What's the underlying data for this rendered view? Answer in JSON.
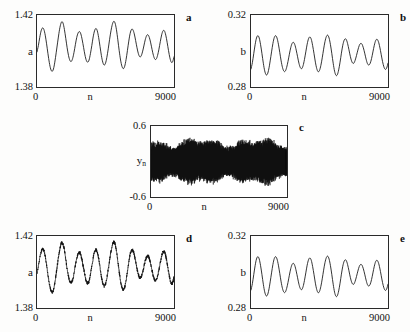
{
  "figure": {
    "background": "#fdfdfc",
    "line_color": "#111111",
    "frame_color": "#2a2a2a",
    "panel_count": 5
  },
  "chart_data": [
    {
      "id": "a",
      "type": "line",
      "panel_letter": "a",
      "title": "",
      "xlabel": "n",
      "ylabel": "a",
      "xlim": [
        0,
        9000
      ],
      "ylim": [
        1.38,
        1.42
      ],
      "xticks": [
        0,
        9000
      ],
      "xticklabels": [
        "0",
        "9000"
      ],
      "yticks": [
        1.38,
        1.42
      ],
      "yticklabels": [
        "1.38",
        "1.42"
      ],
      "grid": false,
      "legend": "none",
      "note": "clean chaotic amplitude-modulated oscillation",
      "x": [
        0,
        90,
        180,
        270,
        360,
        450,
        540,
        630,
        720,
        810,
        900,
        990,
        1080,
        1170,
        1260,
        1350,
        1440,
        1530,
        1620,
        1710,
        1800,
        1890,
        1980,
        2070,
        2160,
        2250,
        2340,
        2430,
        2520,
        2610,
        2700,
        2790,
        2880,
        2970,
        3060,
        3150,
        3240,
        3330,
        3420,
        3510,
        3600,
        3690,
        3780,
        3870,
        3960,
        4050,
        4140,
        4230,
        4320,
        4410,
        4500,
        4590,
        4680,
        4770,
        4860,
        4950,
        5040,
        5130,
        5220,
        5310,
        5400,
        5490,
        5580,
        5670,
        5760,
        5850,
        5940,
        6030,
        6120,
        6210,
        6300,
        6390,
        6480,
        6570,
        6660,
        6750,
        6840,
        6930,
        7020,
        7110,
        7200,
        7290,
        7380,
        7470,
        7560,
        7650,
        7740,
        7830,
        7920,
        8010,
        8100,
        8190,
        8280,
        8370,
        8460,
        8550,
        8640,
        8730,
        8820,
        8910,
        9000
      ],
      "values": [
        1.3995,
        1.403,
        1.4075,
        1.4112,
        1.4128,
        1.412,
        1.4088,
        1.404,
        1.3985,
        1.3935,
        1.39,
        1.3887,
        1.39,
        1.3938,
        1.399,
        1.4045,
        1.4098,
        1.414,
        1.4162,
        1.4155,
        1.412,
        1.407,
        1.4018,
        1.3975,
        1.3948,
        1.3942,
        1.3958,
        1.3992,
        1.4035,
        1.4075,
        1.41,
        1.4108,
        1.4095,
        1.4062,
        1.402,
        1.3978,
        1.3948,
        1.3938,
        1.395,
        1.3985,
        1.403,
        1.4078,
        1.4112,
        1.4125,
        1.4112,
        1.4075,
        1.4025,
        1.3975,
        1.3938,
        1.3922,
        1.3932,
        1.3965,
        1.4012,
        1.4065,
        1.4112,
        1.4148,
        1.4165,
        1.4155,
        1.4118,
        1.4062,
        1.4002,
        1.395,
        1.3915,
        1.3902,
        1.3915,
        1.3952,
        1.4002,
        1.4055,
        1.4098,
        1.412,
        1.4118,
        1.4095,
        1.4058,
        1.4018,
        1.3985,
        1.3968,
        1.3972,
        1.3995,
        1.4028,
        1.4062,
        1.4085,
        1.409,
        1.4075,
        1.4045,
        1.4008,
        1.3975,
        1.3955,
        1.3955,
        1.3975,
        1.401,
        1.4052,
        1.409,
        1.4112,
        1.4112,
        1.4088,
        1.4048,
        1.4002,
        1.3962,
        1.3938,
        1.394,
        1.3968
      ]
    },
    {
      "id": "b",
      "type": "line",
      "panel_letter": "b",
      "title": "",
      "xlabel": "n",
      "ylabel": "b",
      "xlim": [
        0,
        9000
      ],
      "ylim": [
        0.28,
        0.32
      ],
      "xticks": [
        0,
        9000
      ],
      "xticklabels": [
        "0",
        "9000"
      ],
      "yticks": [
        0.28,
        0.32
      ],
      "yticklabels": [
        "0.28",
        "0.32"
      ],
      "grid": false,
      "legend": "none",
      "note": "clean chaotic oscillation, same modulation as panel a",
      "x": [
        0,
        90,
        180,
        270,
        360,
        450,
        540,
        630,
        720,
        810,
        900,
        990,
        1080,
        1170,
        1260,
        1350,
        1440,
        1530,
        1620,
        1710,
        1800,
        1890,
        1980,
        2070,
        2160,
        2250,
        2340,
        2430,
        2520,
        2610,
        2700,
        2790,
        2880,
        2970,
        3060,
        3150,
        3240,
        3330,
        3420,
        3510,
        3600,
        3690,
        3780,
        3870,
        3960,
        4050,
        4140,
        4230,
        4320,
        4410,
        4500,
        4590,
        4680,
        4770,
        4860,
        4950,
        5040,
        5130,
        5220,
        5310,
        5400,
        5490,
        5580,
        5670,
        5760,
        5850,
        5940,
        6030,
        6120,
        6210,
        6300,
        6390,
        6480,
        6570,
        6660,
        6750,
        6840,
        6930,
        7020,
        7110,
        7200,
        7290,
        7380,
        7470,
        7560,
        7650,
        7740,
        7830,
        7920,
        8010,
        8100,
        8190,
        8280,
        8370,
        8460,
        8550,
        8640,
        8730,
        8820,
        8910,
        9000
      ],
      "values": [
        0.29,
        0.2935,
        0.2985,
        0.3035,
        0.3072,
        0.3085,
        0.3072,
        0.3035,
        0.2985,
        0.2932,
        0.289,
        0.2868,
        0.2872,
        0.29,
        0.2945,
        0.2995,
        0.3042,
        0.3075,
        0.3085,
        0.3072,
        0.3038,
        0.2992,
        0.2945,
        0.2908,
        0.2888,
        0.2888,
        0.2908,
        0.2942,
        0.2982,
        0.3018,
        0.3042,
        0.3048,
        0.3035,
        0.3005,
        0.2968,
        0.2932,
        0.2908,
        0.2902,
        0.2918,
        0.2952,
        0.2995,
        0.3038,
        0.3068,
        0.3078,
        0.3065,
        0.303,
        0.2985,
        0.2938,
        0.2902,
        0.2885,
        0.2892,
        0.292,
        0.2962,
        0.301,
        0.3052,
        0.308,
        0.3088,
        0.3072,
        0.3035,
        0.2985,
        0.2932,
        0.2888,
        0.2865,
        0.2868,
        0.2895,
        0.2938,
        0.2988,
        0.3032,
        0.306,
        0.3068,
        0.3055,
        0.3025,
        0.2988,
        0.2955,
        0.2935,
        0.2932,
        0.2948,
        0.2975,
        0.3005,
        0.303,
        0.3042,
        0.3038,
        0.3018,
        0.2988,
        0.2955,
        0.293,
        0.2922,
        0.2932,
        0.2958,
        0.2995,
        0.3032,
        0.3058,
        0.3065,
        0.3052,
        0.3022,
        0.2982,
        0.2942,
        0.2912,
        0.2898,
        0.2905,
        0.2932
      ]
    },
    {
      "id": "c",
      "type": "line",
      "panel_letter": "c",
      "title": "",
      "xlabel": "n",
      "ylabel": "y_n",
      "ylabel_base": "y",
      "ylabel_sub": "n",
      "xlim": [
        0,
        9000
      ],
      "ylim": [
        -0.6,
        0.6
      ],
      "xticks": [
        0,
        9000
      ],
      "xticklabels": [
        "0",
        "9000"
      ],
      "yticks": [
        -0.6,
        0.6
      ],
      "yticklabels": [
        "-0.6",
        "0.6"
      ],
      "grid": false,
      "legend": "none",
      "note": "dense broadband chaotic noise signal filling roughly +/-0.45",
      "amplitude_envelope": 0.45,
      "sample_count": 900
    },
    {
      "id": "d",
      "type": "line",
      "panel_letter": "d",
      "title": "",
      "xlabel": "n",
      "ylabel": "a",
      "xlim": [
        0,
        9000
      ],
      "ylim": [
        1.38,
        1.42
      ],
      "xticks": [
        0,
        9000
      ],
      "xticklabels": [
        "0",
        "9000"
      ],
      "yticks": [
        1.38,
        1.42
      ],
      "yticklabels": [
        "1.38",
        "1.42"
      ],
      "grid": false,
      "legend": "none",
      "note": "same waveform as panel a with superimposed small-scale noise",
      "noise_amplitude": 0.0012,
      "x": [
        0,
        90,
        180,
        270,
        360,
        450,
        540,
        630,
        720,
        810,
        900,
        990,
        1080,
        1170,
        1260,
        1350,
        1440,
        1530,
        1620,
        1710,
        1800,
        1890,
        1980,
        2070,
        2160,
        2250,
        2340,
        2430,
        2520,
        2610,
        2700,
        2790,
        2880,
        2970,
        3060,
        3150,
        3240,
        3330,
        3420,
        3510,
        3600,
        3690,
        3780,
        3870,
        3960,
        4050,
        4140,
        4230,
        4320,
        4410,
        4500,
        4590,
        4680,
        4770,
        4860,
        4950,
        5040,
        5130,
        5220,
        5310,
        5400,
        5490,
        5580,
        5670,
        5760,
        5850,
        5940,
        6030,
        6120,
        6210,
        6300,
        6390,
        6480,
        6570,
        6660,
        6750,
        6840,
        6930,
        7020,
        7110,
        7200,
        7290,
        7380,
        7470,
        7560,
        7650,
        7740,
        7830,
        7920,
        8010,
        8100,
        8190,
        8280,
        8370,
        8460,
        8550,
        8640,
        8730,
        8820,
        8910,
        9000
      ],
      "values": [
        1.3995,
        1.403,
        1.4075,
        1.4112,
        1.4128,
        1.412,
        1.4088,
        1.404,
        1.3985,
        1.3935,
        1.39,
        1.3887,
        1.39,
        1.3938,
        1.399,
        1.4045,
        1.4098,
        1.414,
        1.4162,
        1.4155,
        1.412,
        1.407,
        1.4018,
        1.3975,
        1.3948,
        1.3942,
        1.3958,
        1.3992,
        1.4035,
        1.4075,
        1.41,
        1.4108,
        1.4095,
        1.4062,
        1.402,
        1.3978,
        1.3948,
        1.3938,
        1.395,
        1.3985,
        1.403,
        1.4078,
        1.4112,
        1.4125,
        1.4112,
        1.4075,
        1.4025,
        1.3975,
        1.3938,
        1.3922,
        1.3932,
        1.3965,
        1.4012,
        1.4065,
        1.4112,
        1.4148,
        1.4165,
        1.4155,
        1.4118,
        1.4062,
        1.4002,
        1.395,
        1.3915,
        1.3902,
        1.3915,
        1.3952,
        1.4002,
        1.4055,
        1.4098,
        1.412,
        1.4118,
        1.4095,
        1.4058,
        1.4018,
        1.3985,
        1.3968,
        1.3972,
        1.3995,
        1.4028,
        1.4062,
        1.4085,
        1.409,
        1.4075,
        1.4045,
        1.4008,
        1.3975,
        1.3955,
        1.3955,
        1.3975,
        1.401,
        1.4052,
        1.409,
        1.4112,
        1.4112,
        1.4088,
        1.4048,
        1.4002,
        1.3962,
        1.3938,
        1.394,
        1.3968
      ]
    },
    {
      "id": "e",
      "type": "line",
      "panel_letter": "e",
      "title": "",
      "xlabel": "n",
      "ylabel": "b",
      "xlim": [
        0,
        9000
      ],
      "ylim": [
        0.28,
        0.32
      ],
      "xticks": [
        0,
        9000
      ],
      "xticklabels": [
        "0",
        "9000"
      ],
      "yticks": [
        0.28,
        0.32
      ],
      "yticklabels": [
        "0.28",
        "0.32"
      ],
      "grid": false,
      "legend": "none",
      "note": "same waveform as panel b, smooth reconstruction",
      "x": [
        0,
        90,
        180,
        270,
        360,
        450,
        540,
        630,
        720,
        810,
        900,
        990,
        1080,
        1170,
        1260,
        1350,
        1440,
        1530,
        1620,
        1710,
        1800,
        1890,
        1980,
        2070,
        2160,
        2250,
        2340,
        2430,
        2520,
        2610,
        2700,
        2790,
        2880,
        2970,
        3060,
        3150,
        3240,
        3330,
        3420,
        3510,
        3600,
        3690,
        3780,
        3870,
        3960,
        4050,
        4140,
        4230,
        4320,
        4410,
        4500,
        4590,
        4680,
        4770,
        4860,
        4950,
        5040,
        5130,
        5220,
        5310,
        5400,
        5490,
        5580,
        5670,
        5760,
        5850,
        5940,
        6030,
        6120,
        6210,
        6300,
        6390,
        6480,
        6570,
        6660,
        6750,
        6840,
        6930,
        7020,
        7110,
        7200,
        7290,
        7380,
        7470,
        7560,
        7650,
        7740,
        7830,
        7920,
        8010,
        8100,
        8190,
        8280,
        8370,
        8460,
        8550,
        8640,
        8730,
        8820,
        8910,
        9000
      ],
      "values": [
        0.29,
        0.2935,
        0.2985,
        0.3035,
        0.3072,
        0.3085,
        0.3072,
        0.3035,
        0.2985,
        0.2932,
        0.289,
        0.2868,
        0.2872,
        0.29,
        0.2945,
        0.2995,
        0.3042,
        0.3075,
        0.3085,
        0.3072,
        0.3038,
        0.2992,
        0.2945,
        0.2908,
        0.2888,
        0.2888,
        0.2908,
        0.2942,
        0.2982,
        0.3018,
        0.3042,
        0.3048,
        0.3035,
        0.3005,
        0.2968,
        0.2932,
        0.2908,
        0.2902,
        0.2918,
        0.2952,
        0.2995,
        0.3038,
        0.3068,
        0.3078,
        0.3065,
        0.303,
        0.2985,
        0.2938,
        0.2902,
        0.2885,
        0.2892,
        0.292,
        0.2962,
        0.301,
        0.3052,
        0.308,
        0.3088,
        0.3072,
        0.3035,
        0.2985,
        0.2932,
        0.2888,
        0.2865,
        0.2868,
        0.2895,
        0.2938,
        0.2988,
        0.3032,
        0.306,
        0.3068,
        0.3055,
        0.3025,
        0.2988,
        0.2955,
        0.2935,
        0.2932,
        0.2948,
        0.2975,
        0.3005,
        0.303,
        0.3042,
        0.3038,
        0.3018,
        0.2988,
        0.2955,
        0.293,
        0.2922,
        0.2932,
        0.2958,
        0.2995,
        0.3032,
        0.3058,
        0.3065,
        0.3052,
        0.3022,
        0.2982,
        0.2942,
        0.2912,
        0.2898,
        0.2905,
        0.2932
      ]
    }
  ]
}
